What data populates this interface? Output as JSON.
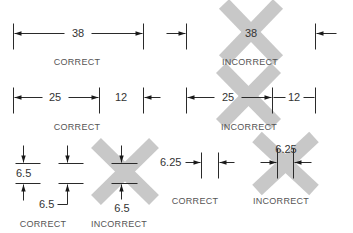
{
  "figure": {
    "background": "#ffffff",
    "line_color": "#2a2a2a",
    "cross_color": "#c8c8c8"
  },
  "crosses": [
    {
      "name": "cross-row1-incorrect",
      "x1": 224,
      "y1": 4,
      "x2": 278,
      "y2": 60
    },
    {
      "name": "cross-row2-incorrect",
      "x1": 221,
      "y1": 68,
      "x2": 276,
      "y2": 124
    },
    {
      "name": "cross-row3-left-incorrect",
      "x1": 96,
      "y1": 143,
      "x2": 154,
      "y2": 200
    },
    {
      "name": "cross-row3-right-incorrect",
      "x1": 257,
      "y1": 137,
      "x2": 314,
      "y2": 190
    }
  ],
  "lines": [
    {
      "name": "row1-correct-ext-left",
      "x1": 13,
      "y1": 23,
      "x2": 13,
      "y2": 49
    },
    {
      "name": "row1-correct-ext-right",
      "x1": 143,
      "y1": 23,
      "x2": 143,
      "y2": 49
    },
    {
      "name": "row1-correct-dim-left",
      "x1": 14,
      "y1": 33,
      "x2": 64,
      "y2": 33
    },
    {
      "name": "row1-correct-dim-right",
      "x1": 91,
      "y1": 33,
      "x2": 142,
      "y2": 33
    },
    {
      "name": "row1-incorrect-ext-left",
      "x1": 186,
      "y1": 23,
      "x2": 186,
      "y2": 49
    },
    {
      "name": "row1-incorrect-ext-right",
      "x1": 315,
      "y1": 23,
      "x2": 315,
      "y2": 49
    },
    {
      "name": "row1-incorrect-arrow-left-tail",
      "x1": 166,
      "y1": 33,
      "x2": 185,
      "y2": 33
    },
    {
      "name": "row1-incorrect-arrow-right-tail",
      "x1": 316,
      "y1": 33,
      "x2": 336,
      "y2": 33
    },
    {
      "name": "row2-correct-ext-left",
      "x1": 13,
      "y1": 87,
      "x2": 13,
      "y2": 113
    },
    {
      "name": "row2-correct-ext-mid",
      "x1": 99,
      "y1": 87,
      "x2": 99,
      "y2": 113
    },
    {
      "name": "row2-correct-ext-right",
      "x1": 143,
      "y1": 87,
      "x2": 143,
      "y2": 113
    },
    {
      "name": "row2-correct-dim-left",
      "x1": 14,
      "y1": 97,
      "x2": 42,
      "y2": 97
    },
    {
      "name": "row2-correct-dim-right",
      "x1": 68,
      "y1": 97,
      "x2": 98,
      "y2": 97
    },
    {
      "name": "row2-correct-arrow-tail",
      "x1": 144,
      "y1": 97,
      "x2": 160,
      "y2": 97
    },
    {
      "name": "row2-incorrect-ext-left",
      "x1": 186,
      "y1": 87,
      "x2": 186,
      "y2": 113
    },
    {
      "name": "row2-incorrect-ext-mid",
      "x1": 272,
      "y1": 87,
      "x2": 272,
      "y2": 113
    },
    {
      "name": "row2-incorrect-ext-right",
      "x1": 315,
      "y1": 87,
      "x2": 315,
      "y2": 113
    },
    {
      "name": "row2-incorrect-dim-left",
      "x1": 187,
      "y1": 97,
      "x2": 214,
      "y2": 97
    },
    {
      "name": "row2-incorrect-dim-right",
      "x1": 241,
      "y1": 97,
      "x2": 271,
      "y2": 97
    },
    {
      "name": "row2-incorrect-dim-12-left",
      "x1": 273,
      "y1": 97,
      "x2": 285,
      "y2": 97
    },
    {
      "name": "row2-incorrect-dim-12-right",
      "x1": 303,
      "y1": 97,
      "x2": 314,
      "y2": 97
    },
    {
      "name": "row3-a-ext-top",
      "x1": 15,
      "y1": 163,
      "x2": 40,
      "y2": 163
    },
    {
      "name": "row3-a-ext-bottom",
      "x1": 15,
      "y1": 183,
      "x2": 40,
      "y2": 183
    },
    {
      "name": "row3-a-arrow-top-tail",
      "x1": 23,
      "y1": 145,
      "x2": 23,
      "y2": 162
    },
    {
      "name": "row3-a-arrow-bottom-tail",
      "x1": 23,
      "y1": 184,
      "x2": 23,
      "y2": 200
    },
    {
      "name": "row3-b-ext-top",
      "x1": 58,
      "y1": 163,
      "x2": 83,
      "y2": 163
    },
    {
      "name": "row3-b-ext-bottom",
      "x1": 58,
      "y1": 183,
      "x2": 83,
      "y2": 183
    },
    {
      "name": "row3-b-arrow-top-tail",
      "x1": 67,
      "y1": 145,
      "x2": 67,
      "y2": 162
    },
    {
      "name": "row3-b-leader-vertical",
      "x1": 67,
      "y1": 184,
      "x2": 67,
      "y2": 204
    },
    {
      "name": "row3-b-leader-horizontal",
      "x1": 57,
      "y1": 204,
      "x2": 67,
      "y2": 204
    },
    {
      "name": "row3-c-ext-top",
      "x1": 111,
      "y1": 163,
      "x2": 137,
      "y2": 163
    },
    {
      "name": "row3-c-ext-bottom",
      "x1": 111,
      "y1": 183,
      "x2": 137,
      "y2": 183
    },
    {
      "name": "row3-c-arrow-top-tail",
      "x1": 121,
      "y1": 145,
      "x2": 121,
      "y2": 162
    },
    {
      "name": "row3-c-arrow-bottom-tail",
      "x1": 121,
      "y1": 184,
      "x2": 121,
      "y2": 199
    },
    {
      "name": "row3-d-ext-left",
      "x1": 201,
      "y1": 152,
      "x2": 201,
      "y2": 178
    },
    {
      "name": "row3-d-ext-right",
      "x1": 218,
      "y1": 152,
      "x2": 218,
      "y2": 178
    },
    {
      "name": "row3-d-arrow-left-tail",
      "x1": 185,
      "y1": 162,
      "x2": 200,
      "y2": 162
    },
    {
      "name": "row3-d-arrow-right-tail",
      "x1": 219,
      "y1": 162,
      "x2": 234,
      "y2": 162
    },
    {
      "name": "row3-e-ext-left",
      "x1": 277,
      "y1": 148,
      "x2": 277,
      "y2": 178
    },
    {
      "name": "row3-e-ext-right",
      "x1": 293,
      "y1": 148,
      "x2": 293,
      "y2": 178
    },
    {
      "name": "row3-e-arrow-left-tail",
      "x1": 260,
      "y1": 162,
      "x2": 276,
      "y2": 162
    },
    {
      "name": "row3-e-arrow-right-tail",
      "x1": 294,
      "y1": 162,
      "x2": 311,
      "y2": 162
    }
  ],
  "arrowheads": [
    {
      "name": "row1-correct-arrow-left",
      "tip": [
        14,
        33
      ],
      "dir": "left"
    },
    {
      "name": "row1-correct-arrow-right",
      "tip": [
        142,
        33
      ],
      "dir": "right"
    },
    {
      "name": "row1-incorrect-arrow-left",
      "tip": [
        185,
        33
      ],
      "dir": "right"
    },
    {
      "name": "row1-incorrect-arrow-right",
      "tip": [
        316,
        33
      ],
      "dir": "left"
    },
    {
      "name": "row2-correct-arrow-left",
      "tip": [
        14,
        97
      ],
      "dir": "left"
    },
    {
      "name": "row2-correct-arrow-mid",
      "tip": [
        98,
        97
      ],
      "dir": "right"
    },
    {
      "name": "row2-correct-arrow-right",
      "tip": [
        144,
        97
      ],
      "dir": "left"
    },
    {
      "name": "row2-incorrect-arrow-left",
      "tip": [
        187,
        97
      ],
      "dir": "left"
    },
    {
      "name": "row2-incorrect-arrow-mid",
      "tip": [
        271,
        97
      ],
      "dir": "right"
    },
    {
      "name": "row3-a-arrow-top",
      "tip": [
        23,
        162
      ],
      "dir": "down"
    },
    {
      "name": "row3-a-arrow-bottom",
      "tip": [
        23,
        184
      ],
      "dir": "up"
    },
    {
      "name": "row3-b-arrow-top",
      "tip": [
        67,
        162
      ],
      "dir": "down"
    },
    {
      "name": "row3-b-arrow-bottom",
      "tip": [
        67,
        184
      ],
      "dir": "up"
    },
    {
      "name": "row3-c-arrow-top",
      "tip": [
        121,
        162
      ],
      "dir": "down"
    },
    {
      "name": "row3-c-arrow-bottom",
      "tip": [
        121,
        184
      ],
      "dir": "up"
    },
    {
      "name": "row3-d-arrow-left",
      "tip": [
        200,
        162
      ],
      "dir": "right"
    },
    {
      "name": "row3-d-arrow-right",
      "tip": [
        219,
        162
      ],
      "dir": "left"
    },
    {
      "name": "row3-e-arrow-left",
      "tip": [
        276,
        162
      ],
      "dir": "right"
    },
    {
      "name": "row3-e-arrow-right",
      "tip": [
        294,
        162
      ],
      "dir": "left"
    }
  ],
  "texts": [
    {
      "name": "row1-correct-value",
      "text": "38",
      "x": 78,
      "y": 37,
      "cls": "val",
      "anchor": "middle"
    },
    {
      "name": "row1-correct-label",
      "text": "CORRECT",
      "x": 77,
      "y": 65,
      "cls": "lbl",
      "anchor": "middle"
    },
    {
      "name": "row1-incorrect-value",
      "text": "38",
      "x": 251,
      "y": 37,
      "cls": "val",
      "anchor": "middle"
    },
    {
      "name": "row1-incorrect-label",
      "text": "INCORRECT",
      "x": 250,
      "y": 65,
      "cls": "lbl",
      "anchor": "middle"
    },
    {
      "name": "row2-correct-value-25",
      "text": "25",
      "x": 55,
      "y": 101,
      "cls": "val",
      "anchor": "middle"
    },
    {
      "name": "row2-correct-value-12",
      "text": "12",
      "x": 121,
      "y": 101,
      "cls": "val",
      "anchor": "middle"
    },
    {
      "name": "row2-correct-label",
      "text": "CORRECT",
      "x": 77,
      "y": 130,
      "cls": "lbl",
      "anchor": "middle"
    },
    {
      "name": "row2-incorrect-value-25",
      "text": "25",
      "x": 228,
      "y": 101,
      "cls": "val",
      "anchor": "middle"
    },
    {
      "name": "row2-incorrect-value-12",
      "text": "12",
      "x": 294,
      "y": 101,
      "cls": "val",
      "anchor": "middle"
    },
    {
      "name": "row2-incorrect-label",
      "text": "INCORRECT",
      "x": 249,
      "y": 130,
      "cls": "lbl",
      "anchor": "middle"
    },
    {
      "name": "row3-a-value",
      "text": "6.5",
      "x": 16,
      "y": 177,
      "cls": "val",
      "anchor": "start"
    },
    {
      "name": "row3-b-value",
      "text": "6.5",
      "x": 39,
      "y": 208,
      "cls": "val",
      "anchor": "start"
    },
    {
      "name": "row3-c-value",
      "text": "6.5",
      "x": 122,
      "y": 212,
      "cls": "val",
      "anchor": "middle"
    },
    {
      "name": "row3-left-correct-label",
      "text": "CORRECT",
      "x": 43,
      "y": 227,
      "cls": "lbl",
      "anchor": "middle"
    },
    {
      "name": "row3-left-incorrect-label",
      "text": "INCORRECT",
      "x": 119,
      "y": 227,
      "cls": "lbl",
      "anchor": "middle"
    },
    {
      "name": "row3-d-value",
      "text": "6.25",
      "x": 160,
      "y": 166,
      "cls": "val",
      "anchor": "start"
    },
    {
      "name": "row3-e-value",
      "text": "6.25",
      "x": 286,
      "y": 153,
      "cls": "val",
      "anchor": "middle"
    },
    {
      "name": "row3-right-correct-label",
      "text": "CORRECT",
      "x": 195,
      "y": 204,
      "cls": "lbl",
      "anchor": "middle"
    },
    {
      "name": "row3-right-incorrect-label",
      "text": "INCORRECT",
      "x": 281,
      "y": 204,
      "cls": "lbl",
      "anchor": "middle"
    }
  ]
}
